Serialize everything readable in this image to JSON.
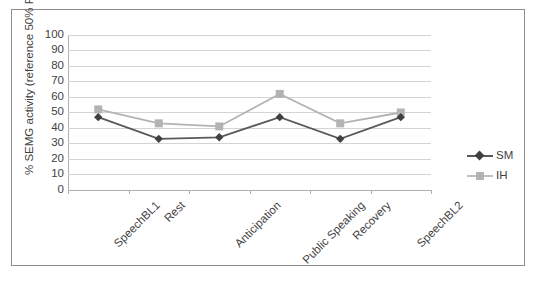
{
  "chart_data": {
    "type": "line",
    "title": "",
    "xlabel": "",
    "ylabel": "% SEMG activity (reference 50% RVC)",
    "ylim": [
      0,
      100
    ],
    "ytick_step": 10,
    "yticks": [
      "100",
      "90",
      "80",
      "70",
      "60",
      "50",
      "40",
      "30",
      "20",
      "10",
      "0"
    ],
    "grid": true,
    "legend_position": "right",
    "categories": [
      "SpeechBL1",
      "Rest",
      "Anticipation",
      "Public Speaking",
      "Recovery",
      "SpeechBL2"
    ],
    "series": [
      {
        "name": "SM",
        "color": "#595959",
        "marker": "diamond",
        "values": [
          47,
          33,
          34,
          47,
          33,
          47
        ]
      },
      {
        "name": "IH",
        "color": "#b3b3b3",
        "marker": "square",
        "values": [
          52,
          43,
          41,
          62,
          43,
          50
        ]
      }
    ]
  },
  "legend": {
    "items": [
      {
        "label": "SM",
        "color": "#595959",
        "marker": "diamond"
      },
      {
        "label": "IH",
        "color": "#b3b3b3",
        "marker": "square"
      }
    ]
  },
  "colors": {
    "series_sm": "#595959",
    "series_ih": "#b3b3b3",
    "gridline": "#d4d4d4",
    "axis": "#b0b0b0",
    "frame_border": "#8d8d8d",
    "text": "#3f3f3f",
    "background": "#ffffff"
  }
}
